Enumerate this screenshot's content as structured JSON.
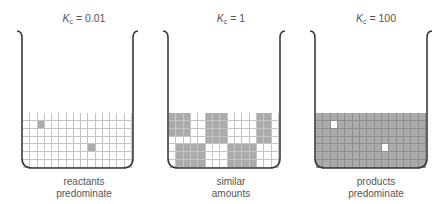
{
  "figure": {
    "colors": {
      "reactant_cell": "#ffffff",
      "product_cell": "#ababab",
      "beaker_outline": "#3a3a3a",
      "gridline": "#c4c4c4"
    },
    "grid": {
      "columns": 15,
      "rows": 7
    },
    "beakers": [
      {
        "id": "low-kc",
        "kc_symbol": "K",
        "kc_subscript": "c",
        "kc_value": "= 0.01",
        "caption_line1": "reactants",
        "caption_line2": "predominate",
        "default_fill": "white",
        "product_cells": [
          [
            1,
            2
          ],
          [
            4,
            9
          ]
        ]
      },
      {
        "id": "mid-kc",
        "kc_symbol": "K",
        "kc_subscript": "c",
        "kc_value": "= 1",
        "caption_line1": "similar",
        "caption_line2": "amounts",
        "default_fill": "white",
        "product_blocks": [
          {
            "rows": [
              0,
              2
            ],
            "cols": [
              0,
              2
            ]
          },
          {
            "rows": [
              0,
              3
            ],
            "cols": [
              5,
              7
            ]
          },
          {
            "rows": [
              0,
              3
            ],
            "cols": [
              12,
              13
            ]
          },
          {
            "rows": [
              4,
              6
            ],
            "cols": [
              1,
              4
            ]
          },
          {
            "rows": [
              4,
              6
            ],
            "cols": [
              8,
              11
            ]
          }
        ]
      },
      {
        "id": "high-kc",
        "kc_symbol": "K",
        "kc_subscript": "c",
        "kc_value": "= 100",
        "caption_line1": "products",
        "caption_line2": "predominate",
        "default_fill": "gray",
        "reactant_cells": [
          [
            1,
            2
          ],
          [
            4,
            9
          ]
        ]
      }
    ]
  }
}
